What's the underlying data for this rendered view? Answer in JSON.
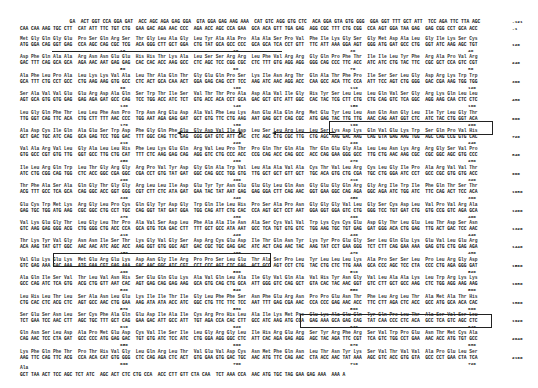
{
  "figure": {
    "type": "nucleotide and deduced amino acid sequence",
    "header_rows": [
      {
        "nt": "                  GA  ACT GGT CCA GGA GAT  ACC AGC AGA GAG GGA  GTA GGA GAG AAG AAA  CAT GTC AGG GTG CTC  ACA GGA GTA GTG GGG  GGA GGT TTT GCT ATT  TCC AGA TTC TTA AGC",
        "end": "-121"
      },
      {
        "nt": "CAA CAA AAG TGC CTT  CAT ATT TTC TGT CTG  GAA GAC AGA AAC CCC  AGA ACC AGC CCA GAA  GCA ACA GTT TGA GAG  AGG CGC TTT CTG CGG  CCA AGT GGA TAA GAG  GAG CGG CCT GCA ACC",
        "end": "-1"
      }
    ],
    "blocks": [
      {
        "aa": "Met Gly Gln Gly Glu  Pro Ser Gln Arg Ser  Thr Gly Leu Ala Gly  Leu Tyr Ala Ala Pro  Ala Ala Ser Pro Val  Phe Ile Lys Gly Ser  Gly Met Asp Ala Leu  Gly Ile Lys Ser Cys",
        "nt": "ATG GGA CAG GGT GAG  CCA AGC CAG CGC TCG  ACA GGG CTT GCT GGA  CTG TAT GCA GCC CCC  GCA GCA TCA CCT GTT  TTC ATT AAA GGA AGT  GGG ATG GAT GCC CTG  GGT ATC AAG AGC TGT",
        "end": "120",
        "nums": [
          "10",
          "20",
          "30",
          "40"
        ]
      },
      {
        "aa": "Asp Phe Gln Ala Ala  Arg Asn Asn Glu Glu  His His Thr Lys Ala  Leu Ser Ser Arg Arg  Leu Phe Val Arg Arg  Gly Gln Pro Phe Thr  Ile Ile Leu Tyr Phe  Arg Ala Pro Val Arg",
        "nt": "GAC TTT CAG GCA GCA  AGA AAC AAT GAG GAG  CAC CAC ACC AAG GCC  CTC AGC TCC CGG CGC  CTC TTT GTG AGG AGG  GGG CAG CCC TTC ACC  ATC ATC CTG TAC TTC  CGC GCT CCA GTC CGT",
        "end": "240",
        "nums": [
          "50",
          "60",
          "70",
          "80"
        ]
      },
      {
        "aa": "Ala Phe Leu Pro Ala  Leu Lys Lys Val Ala  Leu Thr Ala Gln Thr  Gly Glu Gln Pro Ser  Lys Ile Asn Arg Thr  Gln Ala Thr Phe Pro  Ile Ser Ser Leu Gly  Asp Arg Lys Trp Trp",
        "nt": "GCA TTT CTG CCT GCC  CTG AAG AAG GTG GCC  CTC ACT GCA CAA ACT  GGA GAG CAG CCT TCC  AAG ATC AAC AGG ACC  CAA GCC ACA TTC CCA  ATT TCC AGT CTG GGG  GAC CGA AAG TGG TGG",
        "end": "360",
        "nums": [
          "90",
          "100",
          "110",
          "120"
        ]
      },
      {
        "aa": "Ser Ala Val Val Glu  Glu Arg Asp Ala Gln  Ser Trp Thr Ile Ser  Val Thr Thr Pro Ala  Asp Ala Val Ile Gly  His Tyr Ser Leu Leu  Leu Gln Val Ser Gly  Arg Lys Gln Leu Leu",
        "nt": "AGT GCA GTG GTG GAG  GAG AGA GAT GCC CAG  TCC TGG ACC ATC TCT  GTG ACC ACA CCT GCA  GAC GCT GTC ATT GGC  CAC TAC TCG CTT CTG  CTG CAG GTC TCA GGC  AGG AAG CAA CTC CTC",
        "end": "480",
        "nums": [
          "130",
          "140",
          "150",
          "160"
        ]
      },
      {
        "aa": "Leu Gly Gln Phe Thr  Leu Leu Phe Asn Pro  Trp Asn Arg Glu Asp  Ala Val Phe Leu Lys  Asn Glu Ala Gln Arg  Met Glu Tyr Leu Leu  Asn Gln Asn Gly Leu  Ile Tyr Leu Gly Thr",
        "nt": "TTG GGT CAG TTC ACA  CTG CTT TTT AAC CCC  TGG AAT AGA GAG GAT  GCT GTG TTC CTG AAG  AAT GAG GCT CAG CGC  ATG GAG TAC TTG TTG  AAC CAG AAT GGT CTC  ATC TAC CTG GGT ACA",
        "end": "600",
        "nums": [
          "170",
          "180",
          "190",
          "200"
        ]
      },
      {
        "aa": "Ala Asp Cys Ile Gln  Ala Glu Ser Trp Asp  Phe Gly Gln Phe Glu  Gly Asp Val Ile Asp  Leu Ser Leu Arg Leu  Leu Ser Lys Asp Lys  Gln Val Glu Lys Trp  Ser Gln Pro Val His",
        "nt": "GCT GAC TGC ATC CAG  GCA GAG TCC TGG GAC  TTT GGC CAG TTC GAG  GGG GAT GTC ATT GAC  CTC AGC CTG CGC TTG  CTG AGC AAG GAC AAG  CAG GTA GAG AAG TGG  AGC CAG CCG GTG CAC",
        "end": "720",
        "nums": [
          "210",
          "220",
          "230",
          "240"
        ]
      },
      {
        "aa": "Val Ala Arg Val Leu  Gly Ala Leu Leu His  Phe Leu Lys Glu Gln  Arg Val Leu Pro Thr  Pro Gln Thr Gln Ala  Thr Gln Glu Gly Ala  Leu Leu Asn Lys Arg  Arg Gly Ser Val Pro",
        "nt": "GTG GCC CGT GTG TTG  GGT GCC TTG CTG CAT  TTT CTC AAG GAG CAG  AGG GTC CTG CCC ACC  CCG CAG ACC CAG GCC  ACC CAG GAA GGG GCC  TTG CTG AAC AAG CGC  CGC GGC AGC GTG CCC",
        "end": "840",
        "nums": [
          "250",
          "260",
          "270",
          "280"
        ]
      },
      {
        "aa": "Ile Leu Arg Gln Trp  Leu Thr Gly Arg Gly  Arg Pro Val Tyr Asp  Gly Gln Ala Trp Val  Leu Ala Ala Val Ala  Cys Thr Val Leu Arg  Cys Leu Gly Ile Pro  Ala Arg Val Val Thr",
        "nt": "ATC CTG CGG CAG TGG  CTC ACC GGC CGA GGC  CGA CCT GTG TAT GAT  GGC CAG GCC TGG GTG  TTG GCT GCT GTT GCT  TGC ACA GTG CTG CGA  TGC CTG GGA ATC CCT  GCC CGC GTG GTG ACC",
        "end": "960",
        "nums": [
          "290",
          "300",
          "310",
          "320"
        ]
      },
      {
        "aa": "Thr Phe Ala Ser Ala  Gln Gly Thr Gly Gly  Arg Leu Leu Ile Asp  Glu Tyr Tyr Asn Glu  Glu Gly Leu Gln Asn  Gly Glu Gly Gln Arg  Gly Arg Ile Trp Ile  Phe Gln Thr Ser Thr",
        "nt": "ACG TTT GCC TCA GCA  CAG GGC ACC GGT GGG  CGT CTT CTC ATA GAT  GAA TAC TAT AAT GAG  GAG GGA CTT CAG AAC  GGT GAA GGC CAG AGA  GGC AGA ATC TGG ATC  TTC CAG ACT TCC ACA",
        "end": "1080",
        "nums": [
          "330",
          "340",
          "350",
          "360"
        ]
      },
      {
        "aa": "Glu Cys Trp Met Lys  Arg Gly Leu Pro Cys  Gln Gly Tyr Asp Gly  Trp Gln Ile Leu His  Pro Ser Ala Pro Asn  Gly Gly Gly Val Leu  Gly Ser Cys Asp Leu  Val Pro Val Arg Ala",
        "nt": "GAG TGC TGG ATG AAG  CGC GGC CTG CCT TGC  CAG GGT TAT GAT GGA  TGG CAG ATT CTG CAC  CCA AGT GCT CCT AAT  GGA GGT GGA GTC CTG  GGG TCC TGT GAT CTG  GTG CCG GTC AGA GCA",
        "end": "1200",
        "nums": [
          "370",
          "380",
          "390",
          "400"
        ]
      },
      {
        "aa": "Val Lys Glu Gly Thr  Leu Gly Leu Thr Pro  Ala Val Ser Asp Leu  Phe Ala Ala Ile Asn  Ala Ser Cys Val Val  Trp Lys Cys Cys Glu  Asp Gly Thr Leu Glu  Leu Thr Asp Ser Asn",
        "nt": "GTC AAG GAG GGG ACG  CTG GGG CTG ACC CCA  GCA GTG TCA GAC CTT  TTT GCT GCC ATA AAT  GCC TCA TGT GTG GTC  TGG AAG TGC TGT GAG  GAT GGG ACA CTG GAG  TTG ACT GAC TCC AAC",
        "end": "1320",
        "nums": [
          "410",
          "420",
          "430",
          "440"
        ]
      },
      {
        "aa": "Thr Lys Tyr Val Gly  Asn Asn Ile Ser Thr  Lys Gly Val Gly Ser  Asp Arg Cys Glu Asp  Ile Thr Gln Asn Tyr  Lys Tyr Pro Glu Gly  Ser Leu Gln Glu Lys  Glu Val Leu Glu Arg",
        "nt": "ACA AAG TAT GTT GGC  AAC AAC ATC AGC ACC  AAG GGT GTG GGC AGT  GAC CGC TGC GAG GAC  ATC ACT CAG AAC TAC  AAG TAT CCT GAA GGG  TCT CTT CAG GAA AAA  GAG GTG CTG GAG AGA",
        "end": "1440",
        "nums": [
          "450",
          "460",
          "470",
          "480"
        ]
      },
      {
        "aa": "Val Glu Lys Glu Lys  Met Glu Arg Glu Lys  Asp Asn Gly Ile Arg  Pro Pro Ser Leu Glu  Thr Ala Ser Pro Leu  Tyr Leu Leu Leu Lys  Ala Pro Ser Ser Leu  Pro Leu Arg Gly Asp",
        "nt": "GTC GAG AAA GAC AAA  ATG GAA CGT GAG AAA  GAC AAC GGC ATC CGT  CCT CCC AGT CTC GAG  ACT GCC AGT CCT CTG  TAC CTG CTC TTG AAA  GCA CCC AGC TCC CTA  CCC CTG AGA GGG GAT",
        "end": "1560",
        "nums": [
          "490",
          "500",
          "510",
          "520"
        ]
      },
      {
        "aa": "Ala Gln Ile Ser Val  Thr Leu Val Asn His  Ser Glu Gln Glu Lys  Ala Val Gln Leu Ala  Ile Gly Val Gln Ala  Val His Tyr Asn Gly  Val Leu Ala Ala Lys  Leu Trp Arg Lys Lys",
        "nt": "GCC CAG ATC TCA GTG  ACG CTG GTT AAT CAC  AGT GAG CAG GAG AAG  GCA GTG CAG CTG GCA  ATT GGG GTC CAG GCT  GTA CAC TAC AAC GGT  GTC CTT GCT GCC AAG  CTC TGG AGG AAG AAG",
        "end": "1680",
        "nums": [
          "530",
          "540",
          "550",
          "560"
        ]
      },
      {
        "aa": "Leu His Leu Thr Leu  Ser Ala Asn Leu Glu  Lys Ile Ile Thr Ile  Gly Leu Phe Phe Ser  Asn Phe Glu Arg Asn  Pro Pro Glu Asn Thr  Phe Leu Arg Leu Thr  Ala Met Ala Thr His",
        "nt": "CTG CAC CTC ACG CTC  AGT GCC AAC CTG GAA  AAG ATA ATA ACC ATC  GGC CTG TTC TTC TCC  AAT TTT GAG CGA AAC  CCA CCC GAG AAC ACC  TTC CTT AGA CTC ACC  GCC ATG GCA ACA CAC",
        "end": "1800",
        "nums": [
          "570",
          "580",
          "590",
          "600"
        ]
      },
      {
        "aa": "Ser Glu Ser Asn Leu  Ser Cys Phe Ala Gln  Glu Asp Ile Ala Ile  Cys Arg Pro His Leu  Ala Ile Lys Met Pro  Glu Lys Ala Glu Gln  Tyr Gln Pro Leu Thr  Ala Ser Val Ser Leu",
        "nt": "TCT GAA TCC AAC CTT  AGC TGC TTT GCT CAG  GAA GAC ATT GCC ATT  TGT AGA CCA CAC CTT  GCC ATC AAG ATG CCA  GAG AAA GCA GAG CAG  TAT CAA CCC CTC ACA  GCC TCA GTC AGC CTC",
        "end": "1920",
        "nums": [
          "610",
          "620",
          "630",
          "640"
        ]
      },
      {
        "aa": "Gln Asn Ser Leu Asp  Ala Pro Met Glu Asp  Cys Val Ile Ser Ile  Leu Gly Arg Gly Leu  Ile His Arg Glu Arg  Ser Tyr Arg Phe Arg  Ser Val Trp Pro Glu  Asn Thr Met Cys Ala",
        "nt": "CAG AAC TCC CTA GAT  GCC CCC ATG GAG GAC  TGT GTG ATC TCC ATC  CTG GGA AGG GGC CTC  ATT CAC AGA GAG AGG  AGC TAC AGA TTC CGT  TCA GTC TGG CCT GAA  AAC ACC ATG TGT GCC",
        "end": "2040",
        "nums": [
          "650",
          "660",
          "670",
          "680"
        ]
      },
      {
        "aa": "Lys Phe Gln Phe Thr  Pro Thr His Val Gly  Leu Gln Arg Leu Thr  Val Glu Val Asp Cys  Asn Met Phe Gln Asn  Leu Thr Asn Tyr Lys  Ser Val Thr Val Val  Ala Pro Glu Leu Ser",
        "nt": "AAG TTC CAG TTC ACG  CCA ACA CAT GTG GGG  CTC CAG AGA CTC ACT  GTG GAA GTG GAC TGC  AAC ATG TTC CAG AAC  CTA ACC AAC TAT AAA  AGC GTC ACC GTG GTA  GCC CCT GAA CTA TCA",
        "end": "2160",
        "nums": [
          "690",
          "700",
          "710",
          "720"
        ]
      }
    ],
    "tail": {
      "aa": "Ala",
      "nt": "GCT TAA ACT TCC AGC TCT ATC  AGC ACT CTC CTG CCA  ACC CTT GTT CTA CAA  TCT AAA CCA  AAC ATG TGC TAG GAA GAG AAA  AAA A"
    },
    "annotations": {
      "boxed_peptides": [
        "Met Glu Tyr Leu Leu Asn Gln Asn Gly Leu Ile Tyr Leu Gly",
        "Met Lys Arg Gly Leu Pro Cys Gln Gly Tyr Asp Gly Trp Gln Ile Leu His",
        "Met Pro Glu Lys Ala Glu Gln Tyr Gln Pro Leu Thr Ala Ser Val"
      ],
      "underline": "nt 13-72 region (GGT GAG ... ATG GAT)",
      "double_arrow": "nt region ~630-700"
    }
  }
}
